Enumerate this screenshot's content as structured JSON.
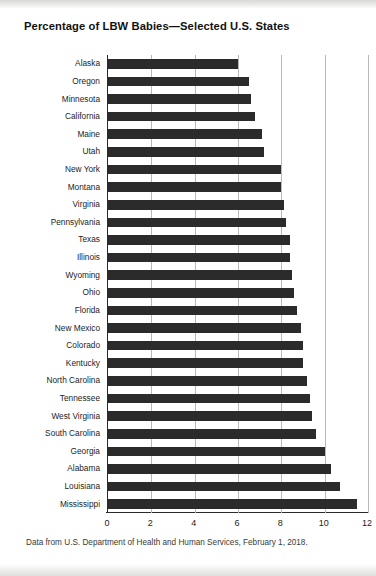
{
  "chart_data": {
    "type": "bar",
    "orientation": "horizontal",
    "title": "Percentage of LBW Babies—Selected U.S. States",
    "caption": "Data from U.S. Department of Health and Human Services, February 1, 2018.",
    "xlabel": "",
    "ylabel": "",
    "xlim": [
      0,
      12
    ],
    "xticks": [
      "0",
      "2",
      "4",
      "6",
      "8",
      "10",
      "12"
    ],
    "xtick_values": [
      0,
      2,
      4,
      6,
      8,
      10,
      12
    ],
    "grid": true,
    "legend": "none",
    "bar_color": "#2b2b2b",
    "categories": [
      "Alaska",
      "Oregon",
      "Minnesota",
      "California",
      "Maine",
      "Utah",
      "New York",
      "Montana",
      "Virginia",
      "Pennsylvania",
      "Texas",
      "Illinois",
      "Wyoming",
      "Ohio",
      "Florida",
      "New Mexico",
      "Colorado",
      "Kentucky",
      "North Carolina",
      "Tennessee",
      "West Virginia",
      "South Carolina",
      "Georgia",
      "Alabama",
      "Louisiana",
      "Mississippi"
    ],
    "values": [
      6.0,
      6.5,
      6.6,
      6.8,
      7.1,
      7.2,
      8.0,
      8.0,
      8.1,
      8.2,
      8.4,
      8.4,
      8.5,
      8.6,
      8.7,
      8.9,
      9.0,
      9.0,
      9.2,
      9.3,
      9.4,
      9.6,
      10.0,
      10.3,
      10.7,
      11.5
    ]
  }
}
